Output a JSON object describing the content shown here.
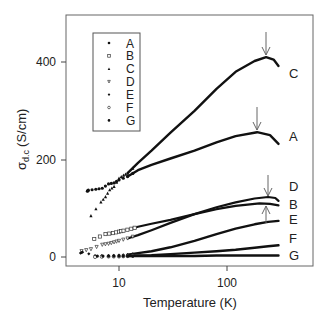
{
  "chart_data": {
    "type": "scatter",
    "title": "",
    "xlabel": "Temperature (K)",
    "ylabel": "σd.c (S/cm)",
    "ylabel_main": "σ",
    "ylabel_sub": "d.c",
    "ylabel_unit": "(S/cm)",
    "xscale": "log",
    "xlim": [
      3.6,
      390
    ],
    "ylim": [
      -18,
      495
    ],
    "xticks": [
      10,
      100
    ],
    "xtick_labels": [
      "10",
      "100"
    ],
    "yticks": [
      0,
      200,
      400
    ],
    "ytick_labels": [
      "0",
      "200",
      "400"
    ],
    "grid": false,
    "legend_position": "upper left (inset box)",
    "legend": [
      "A",
      "B",
      "C",
      "D",
      "E",
      "F",
      "G"
    ],
    "series": [
      {
        "name": "A",
        "marker": "filled-circle",
        "x": [
          5.1,
          5.2,
          6.1,
          7,
          8,
          9,
          10,
          12,
          15,
          20,
          30,
          50,
          80,
          120,
          190,
          250,
          300
        ],
        "y": [
          135,
          137,
          139,
          141,
          150,
          152,
          158,
          165,
          178,
          189,
          202,
          218,
          235,
          248,
          256,
          250,
          232
        ],
        "peak_arrow": {
          "x": 190,
          "y": 256
        }
      },
      {
        "name": "B",
        "marker": "open-square",
        "x": [
          5.9,
          7.5,
          8.8,
          10,
          11,
          13,
          15,
          20,
          30,
          50,
          80,
          120,
          200,
          250,
          300
        ],
        "y": [
          37,
          47,
          49,
          52,
          54,
          58,
          62,
          68,
          76,
          88,
          98,
          105,
          110,
          109,
          106
        ]
      },
      {
        "name": "C",
        "marker": "filled-triangle",
        "x": [
          5.5,
          6.8,
          7.5,
          8.2,
          9,
          10,
          11,
          12,
          15,
          20,
          30,
          50,
          80,
          120,
          180,
          230,
          270,
          300
        ],
        "y": [
          85,
          113,
          124,
          138,
          145,
          162,
          168,
          172,
          193,
          218,
          255,
          300,
          345,
          380,
          402,
          410,
          405,
          392
        ],
        "peak_arrow": {
          "x": 230,
          "y": 410
        }
      },
      {
        "name": "D",
        "marker": "open-triangle-down",
        "x": [
          4.5,
          5.5,
          7,
          8,
          9,
          10,
          12,
          15,
          20,
          30,
          50,
          80,
          120,
          180,
          240,
          280,
          300
        ],
        "y": [
          12,
          16,
          25,
          27,
          30,
          33,
          38,
          45,
          55,
          70,
          88,
          102,
          112,
          120,
          123,
          121,
          115
        ],
        "peak_arrow": {
          "x": 240,
          "y": 123
        }
      },
      {
        "name": "E",
        "marker": "filled-diamond",
        "x": [
          4.4,
          4.6,
          6,
          8,
          10,
          12,
          15,
          20,
          30,
          50,
          80,
          120,
          180,
          240,
          300
        ],
        "y": [
          8,
          10,
          3,
          3,
          4,
          5,
          8,
          12,
          20,
          33,
          47,
          58,
          67,
          72,
          74
        ],
        "arrow_up": {
          "x": 240,
          "y": 72
        }
      },
      {
        "name": "F",
        "marker": "open-circle",
        "x": [
          6,
          8,
          10,
          12,
          15,
          20,
          30,
          50,
          80,
          120,
          180,
          240,
          300
        ],
        "y": [
          0,
          1,
          1,
          2,
          3,
          4,
          6,
          9,
          12,
          15,
          19,
          22,
          24
        ]
      },
      {
        "name": "G",
        "marker": "filled-circle",
        "x": [
          6.3,
          8,
          10,
          12,
          15,
          20,
          30,
          50,
          80,
          120,
          180,
          240,
          300
        ],
        "y": [
          2,
          2,
          2,
          2,
          2,
          2,
          2,
          2,
          3,
          3,
          3,
          3,
          3
        ]
      }
    ],
    "annotations": [
      "Arrow marks peak of C",
      "Arrow marks peak of A",
      "Arrow marks peak of D",
      "Upward arrow marks E/B"
    ]
  },
  "labels": {
    "C": "C",
    "A": "A",
    "D": "D",
    "B": "B",
    "E": "E",
    "F": "F",
    "G": "G"
  }
}
